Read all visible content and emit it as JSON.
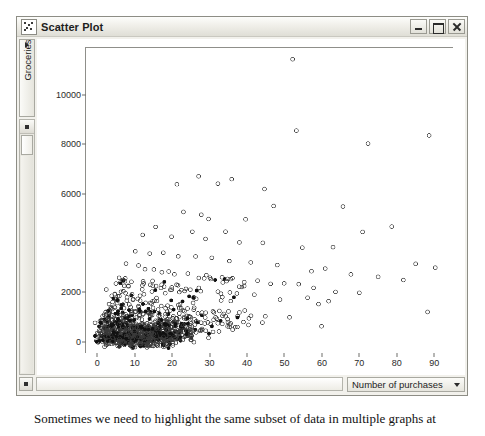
{
  "window": {
    "title": "Scatter Plot",
    "icon": "scatter-plot-icon",
    "buttons": {
      "minimize": "Minimize",
      "maximize": "Maximize",
      "close": "Close"
    }
  },
  "controls": {
    "y_variable": "Groceries",
    "x_variable": "Number of purchases",
    "caret": "▾"
  },
  "caption": {
    "text": "Sometimes we need to highlight the same subset of data in multiple graphs at"
  },
  "colors": {
    "window_bg": "#f2f1ec",
    "titlebar": "#f0efe9",
    "plot_bg": "#ffffff",
    "axis": "#8f8f8a",
    "point_open": "#3a3a3a",
    "point_highlight": "#111111"
  },
  "chart_data": {
    "type": "scatter",
    "title": "Scatter Plot",
    "xlabel": "Number of purchases",
    "ylabel": "Groceries",
    "xlim": [
      -3,
      95
    ],
    "ylim": [
      -450,
      11900
    ],
    "xticks": [
      0,
      10,
      20,
      30,
      40,
      50,
      60,
      70,
      80,
      90
    ],
    "yticks": [
      0,
      2000,
      4000,
      6000,
      8000,
      10000
    ],
    "grid": false,
    "legend": null,
    "marker": "open-circle",
    "marker_size": 4,
    "series": [
      {
        "name": "All customers",
        "style": "open",
        "points": [
          [
            52,
            11500
          ],
          [
            72,
            8100
          ],
          [
            89,
            8300
          ],
          [
            53,
            8550
          ],
          [
            36,
            6600
          ],
          [
            27,
            6750
          ],
          [
            32,
            6400
          ],
          [
            45,
            6100
          ],
          [
            21,
            6350
          ],
          [
            47,
            5500
          ],
          [
            66,
            5450
          ],
          [
            79,
            4750
          ],
          [
            28,
            5200
          ],
          [
            23,
            5300
          ],
          [
            30,
            5000
          ],
          [
            40,
            4900
          ],
          [
            16,
            4600
          ],
          [
            25,
            4550
          ],
          [
            34,
            4500
          ],
          [
            12,
            4350
          ],
          [
            20,
            4250
          ],
          [
            29,
            4200
          ],
          [
            38,
            4100
          ],
          [
            44,
            4000
          ],
          [
            55,
            3900
          ],
          [
            63,
            3850
          ],
          [
            71,
            4450
          ],
          [
            85,
            3150
          ],
          [
            90,
            2950
          ],
          [
            10,
            3750
          ],
          [
            14,
            3650
          ],
          [
            18,
            3550
          ],
          [
            22,
            3450
          ],
          [
            26,
            3400
          ],
          [
            31,
            3350
          ],
          [
            35,
            3250
          ],
          [
            41,
            3150
          ],
          [
            48,
            3050
          ],
          [
            57,
            2950
          ],
          [
            61,
            2900
          ],
          [
            68,
            2750
          ],
          [
            75,
            2600
          ],
          [
            82,
            2500
          ],
          [
            88,
            1200
          ],
          [
            8,
            3150
          ],
          [
            11,
            3050
          ],
          [
            13,
            2950
          ],
          [
            15,
            2900
          ],
          [
            17,
            2850
          ],
          [
            19,
            2800
          ],
          [
            21,
            2750
          ],
          [
            24,
            2700
          ],
          [
            27,
            2650
          ],
          [
            30,
            2600
          ],
          [
            33,
            2550
          ],
          [
            36,
            2500
          ],
          [
            39,
            2450
          ],
          [
            43,
            2400
          ],
          [
            46,
            2350
          ],
          [
            50,
            2300
          ],
          [
            54,
            2250
          ],
          [
            58,
            2200
          ],
          [
            64,
            2100
          ],
          [
            70,
            2000
          ],
          [
            6,
            2550
          ],
          [
            7,
            2450
          ],
          [
            9,
            2400
          ],
          [
            12,
            2350
          ],
          [
            14,
            2300
          ],
          [
            16,
            2250
          ],
          [
            18,
            2200
          ],
          [
            20,
            2150
          ],
          [
            23,
            2100
          ],
          [
            25,
            2050
          ],
          [
            28,
            2000
          ],
          [
            32,
            1950
          ],
          [
            37,
            1900
          ],
          [
            42,
            1850
          ],
          [
            49,
            1800
          ],
          [
            56,
            1700
          ],
          [
            62,
            1600
          ],
          [
            60,
            700
          ],
          [
            59,
            1500
          ],
          [
            4,
            1900
          ],
          [
            5,
            1850
          ],
          [
            6,
            1800
          ],
          [
            8,
            1750
          ],
          [
            10,
            1700
          ],
          [
            11,
            1650
          ],
          [
            13,
            1600
          ],
          [
            15,
            1550
          ],
          [
            17,
            1500
          ],
          [
            19,
            1450
          ],
          [
            22,
            1400
          ],
          [
            24,
            1350
          ],
          [
            26,
            1300
          ],
          [
            29,
            1250
          ],
          [
            31,
            1200
          ],
          [
            34,
            1150
          ],
          [
            38,
            1100
          ],
          [
            41,
            1050
          ],
          [
            45,
            1000
          ],
          [
            51,
            950
          ],
          [
            3,
            1450
          ],
          [
            4,
            1400
          ],
          [
            5,
            1350
          ],
          [
            7,
            1300
          ],
          [
            9,
            1250
          ],
          [
            10,
            1200
          ],
          [
            12,
            1150
          ],
          [
            14,
            1100
          ],
          [
            16,
            1050
          ],
          [
            18,
            1000
          ],
          [
            20,
            950
          ],
          [
            21,
            900
          ],
          [
            23,
            880
          ],
          [
            25,
            850
          ],
          [
            27,
            820
          ],
          [
            30,
            800
          ],
          [
            33,
            780
          ],
          [
            35,
            750
          ],
          [
            39,
            720
          ],
          [
            44,
            700
          ],
          [
            2,
            1050
          ],
          [
            3,
            1000
          ],
          [
            4,
            950
          ],
          [
            5,
            900
          ],
          [
            6,
            870
          ],
          [
            7,
            840
          ],
          [
            8,
            810
          ],
          [
            9,
            780
          ],
          [
            10,
            750
          ],
          [
            11,
            720
          ],
          [
            12,
            700
          ],
          [
            13,
            680
          ],
          [
            14,
            660
          ],
          [
            15,
            640
          ],
          [
            16,
            620
          ],
          [
            17,
            600
          ],
          [
            18,
            580
          ],
          [
            19,
            560
          ],
          [
            20,
            540
          ],
          [
            22,
            520
          ],
          [
            24,
            500
          ],
          [
            26,
            480
          ],
          [
            28,
            460
          ],
          [
            31,
            440
          ],
          [
            36,
            420
          ],
          [
            1,
            700
          ],
          [
            2,
            660
          ],
          [
            3,
            620
          ],
          [
            4,
            590
          ],
          [
            5,
            560
          ],
          [
            6,
            530
          ],
          [
            7,
            500
          ],
          [
            8,
            480
          ],
          [
            9,
            460
          ],
          [
            10,
            440
          ],
          [
            11,
            420
          ],
          [
            12,
            400
          ],
          [
            13,
            390
          ],
          [
            14,
            380
          ],
          [
            15,
            370
          ],
          [
            16,
            360
          ],
          [
            17,
            350
          ],
          [
            18,
            340
          ],
          [
            19,
            330
          ],
          [
            20,
            320
          ],
          [
            21,
            310
          ],
          [
            22,
            300
          ],
          [
            23,
            290
          ],
          [
            24,
            280
          ],
          [
            25,
            270
          ],
          [
            1,
            380
          ],
          [
            2,
            350
          ],
          [
            3,
            330
          ],
          [
            4,
            310
          ],
          [
            5,
            300
          ],
          [
            6,
            290
          ],
          [
            7,
            280
          ],
          [
            8,
            270
          ],
          [
            9,
            260
          ],
          [
            10,
            250
          ],
          [
            11,
            240
          ],
          [
            12,
            230
          ],
          [
            13,
            220
          ],
          [
            14,
            210
          ],
          [
            15,
            200
          ],
          [
            16,
            195
          ],
          [
            17,
            190
          ],
          [
            18,
            185
          ],
          [
            19,
            180
          ],
          [
            20,
            175
          ],
          [
            1,
            180
          ],
          [
            2,
            165
          ],
          [
            3,
            155
          ],
          [
            4,
            145
          ],
          [
            5,
            140
          ],
          [
            6,
            135
          ],
          [
            7,
            130
          ],
          [
            8,
            125
          ],
          [
            9,
            120
          ],
          [
            10,
            115
          ],
          [
            11,
            110
          ],
          [
            12,
            105
          ],
          [
            13,
            100
          ],
          [
            14,
            95
          ],
          [
            15,
            90
          ],
          [
            1,
            70
          ],
          [
            2,
            65
          ],
          [
            3,
            60
          ],
          [
            4,
            55
          ],
          [
            5,
            50
          ],
          [
            6,
            48
          ],
          [
            7,
            46
          ],
          [
            8,
            44
          ],
          [
            9,
            42
          ],
          [
            10,
            40
          ],
          [
            11,
            38
          ],
          [
            12,
            36
          ],
          [
            13,
            34
          ],
          [
            14,
            32
          ],
          [
            15,
            30
          ],
          [
            16,
            28
          ],
          [
            17,
            26
          ],
          [
            18,
            24
          ],
          [
            19,
            22
          ],
          [
            20,
            20
          ]
        ]
      },
      {
        "name": "Highlighted subset",
        "style": "filled",
        "points": [
          [
            6,
            2450
          ],
          [
            9,
            1900
          ],
          [
            4,
            1700
          ],
          [
            12,
            1500
          ],
          [
            7,
            1250
          ],
          [
            14,
            1150
          ],
          [
            3,
            1050
          ],
          [
            17,
            980
          ],
          [
            5,
            880
          ],
          [
            10,
            820
          ],
          [
            20,
            780
          ],
          [
            8,
            700
          ],
          [
            13,
            650
          ],
          [
            2,
            600
          ],
          [
            16,
            560
          ],
          [
            22,
            520
          ],
          [
            6,
            480
          ],
          [
            11,
            440
          ],
          [
            4,
            400
          ],
          [
            19,
            380
          ],
          [
            9,
            350
          ],
          [
            15,
            320
          ],
          [
            3,
            290
          ],
          [
            24,
            270
          ],
          [
            7,
            250
          ],
          [
            12,
            230
          ],
          [
            18,
            210
          ],
          [
            5,
            190
          ],
          [
            10,
            170
          ],
          [
            21,
            150
          ],
          [
            2,
            130
          ],
          [
            14,
            120
          ],
          [
            8,
            100
          ],
          [
            16,
            90
          ],
          [
            4,
            75
          ],
          [
            11,
            60
          ],
          [
            6,
            50
          ],
          [
            13,
            40
          ],
          [
            19,
            35
          ],
          [
            9,
            28
          ],
          [
            23,
            700
          ],
          [
            26,
            560
          ],
          [
            30,
            300
          ],
          [
            25,
            180
          ]
        ]
      }
    ]
  }
}
